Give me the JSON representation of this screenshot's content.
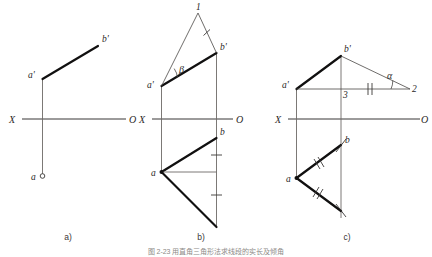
{
  "figure": {
    "caption": "图 2-23  用直角三角形法求线段的实长及倾角",
    "panels": [
      {
        "id": "a",
        "caption": "a)",
        "axis": {
          "left_label": "X",
          "right_label": "O"
        },
        "points": [
          {
            "name": "a-prime",
            "label": "a'"
          },
          {
            "name": "b-prime",
            "label": "b'"
          },
          {
            "name": "a-horizontal",
            "label": "a"
          }
        ]
      },
      {
        "id": "b",
        "caption": "b)",
        "axis": {
          "left_label": "X",
          "right_label": "O"
        },
        "points": [
          {
            "name": "a-prime",
            "label": "a'"
          },
          {
            "name": "b-prime",
            "label": "b'"
          },
          {
            "name": "point-one",
            "label": "1"
          },
          {
            "name": "a-horizontal",
            "label": "a"
          },
          {
            "name": "b-horizontal",
            "label": "b"
          }
        ],
        "angles": [
          {
            "name": "beta-angle",
            "label": "β"
          }
        ]
      },
      {
        "id": "c",
        "caption": "c)",
        "axis": {
          "left_label": "X",
          "right_label": "O"
        },
        "points": [
          {
            "name": "a-prime",
            "label": "a'"
          },
          {
            "name": "b-prime",
            "label": "b'"
          },
          {
            "name": "point-two",
            "label": "2"
          },
          {
            "name": "point-three",
            "label": "3"
          },
          {
            "name": "a-horizontal",
            "label": "a"
          },
          {
            "name": "b-horizontal",
            "label": "b"
          }
        ],
        "angles": [
          {
            "name": "alpha-angle",
            "label": "α"
          }
        ]
      }
    ]
  },
  "colors": {
    "bold_line": "#111010",
    "thin_line": "#4a4745",
    "axis_line": "#22201f",
    "projection_line": "#6d6a67",
    "background": "#ffffff",
    "text": "#2b2928"
  }
}
